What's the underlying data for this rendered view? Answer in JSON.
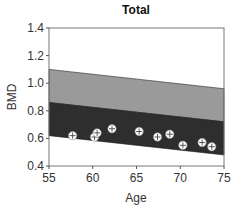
{
  "chart_data": {
    "type": "scatter",
    "title": "Total",
    "xlabel": "Age",
    "ylabel": "BMD",
    "xlim": [
      55,
      75
    ],
    "ylim": [
      0.4,
      1.4
    ],
    "xticks": [
      55,
      60,
      65,
      70,
      75
    ],
    "yticks": [
      "0.4",
      "0.6",
      "0.8",
      "1.0",
      "1.2",
      "1.4"
    ],
    "grid": false,
    "legend": null,
    "bands": [
      {
        "name": "upper reference band",
        "color": "#9a9a9a",
        "x": [
          55,
          75
        ],
        "upper": [
          1.1,
          0.96
        ],
        "lower": [
          0.86,
          0.72
        ]
      },
      {
        "name": "lower reference band",
        "color": "#2e2e2e",
        "x": [
          55,
          75
        ],
        "upper": [
          0.86,
          0.72
        ],
        "lower": [
          0.62,
          0.48
        ]
      }
    ],
    "series": [
      {
        "name": "patient measurements",
        "marker": "circle-cross",
        "points": [
          {
            "x": 57.7,
            "y": 0.62
          },
          {
            "x": 60.2,
            "y": 0.61
          },
          {
            "x": 60.5,
            "y": 0.64
          },
          {
            "x": 62.2,
            "y": 0.67
          },
          {
            "x": 65.3,
            "y": 0.65
          },
          {
            "x": 67.4,
            "y": 0.61
          },
          {
            "x": 68.8,
            "y": 0.63
          },
          {
            "x": 70.3,
            "y": 0.55
          },
          {
            "x": 72.5,
            "y": 0.57
          },
          {
            "x": 73.6,
            "y": 0.54
          }
        ]
      }
    ]
  }
}
